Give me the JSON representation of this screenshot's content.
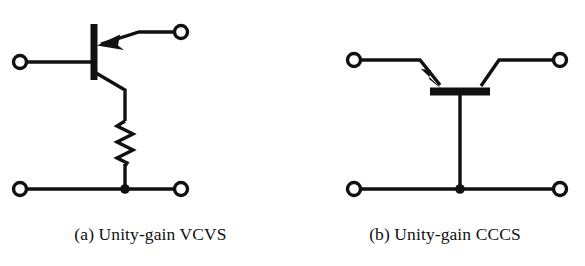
{
  "figure": {
    "background_color": "#ffffff",
    "ink_color": "#111111",
    "width": 585,
    "height": 266,
    "panels": [
      {
        "id": "a",
        "caption": "(a) Unity-gain VCVS",
        "element_name": "voltage-controlled-voltage-source-circuit",
        "terminals": [
          {
            "name": "input-terminal-left",
            "cx": 20,
            "cy": 62,
            "r": 6.5
          },
          {
            "name": "input-terminal-top-right",
            "cx": 181,
            "cy": 32,
            "r": 6.5
          },
          {
            "name": "output-terminal-bottom-left",
            "cx": 20,
            "cy": 189,
            "r": 6.5
          },
          {
            "name": "output-terminal-bottom-right",
            "cx": 181,
            "cy": 189,
            "r": 6.5
          }
        ],
        "components": [
          {
            "name": "transistor-base-bar",
            "type": "vertical-bar",
            "x": 94,
            "y_top": 24,
            "y_bottom": 80,
            "thickness": 7
          },
          {
            "name": "emitter-lead-with-arrow",
            "type": "arrow-lead",
            "direction": "into-base"
          },
          {
            "name": "collector-lead",
            "type": "diagonal-lead"
          },
          {
            "name": "resistor",
            "type": "zigzag",
            "cx": 125,
            "y_top": 121,
            "y_bottom": 166,
            "peaks": 6,
            "amplitude": 9
          },
          {
            "name": "ground-rail",
            "type": "horizontal-wire",
            "y": 189,
            "x_start": 20,
            "x_end": 181
          },
          {
            "name": "junction-dot",
            "type": "node",
            "cx": 125,
            "cy": 189,
            "r": 4.5
          }
        ]
      },
      {
        "id": "b",
        "caption": "(b) Unity-gain CCCS",
        "element_name": "current-controlled-current-source-circuit",
        "terminals": [
          {
            "name": "input-terminal-left",
            "cx": 61,
            "cy": 60,
            "r": 6.5
          },
          {
            "name": "input-terminal-right",
            "cx": 267,
            "cy": 60,
            "r": 6.5
          },
          {
            "name": "output-terminal-bottom-left",
            "cx": 61,
            "cy": 189,
            "r": 6.5
          },
          {
            "name": "output-terminal-bottom-right",
            "cx": 267,
            "cy": 189,
            "r": 6.5
          }
        ],
        "components": [
          {
            "name": "transistor-base-bar",
            "type": "horizontal-bar",
            "x_start": 137,
            "x_end": 197,
            "y": 91,
            "thickness": 8
          },
          {
            "name": "emitter-lead-with-arrow",
            "type": "arrow-lead",
            "direction": "into-base"
          },
          {
            "name": "collector-lead",
            "type": "diagonal-lead"
          },
          {
            "name": "base-stem",
            "type": "vertical-wire",
            "x": 167,
            "y_start": 95,
            "y_end": 189
          },
          {
            "name": "ground-rail",
            "type": "horizontal-wire",
            "y": 189,
            "x_start": 61,
            "x_end": 267
          },
          {
            "name": "junction-dot",
            "type": "node",
            "cx": 167,
            "cy": 189,
            "r": 4.5
          }
        ]
      }
    ]
  }
}
